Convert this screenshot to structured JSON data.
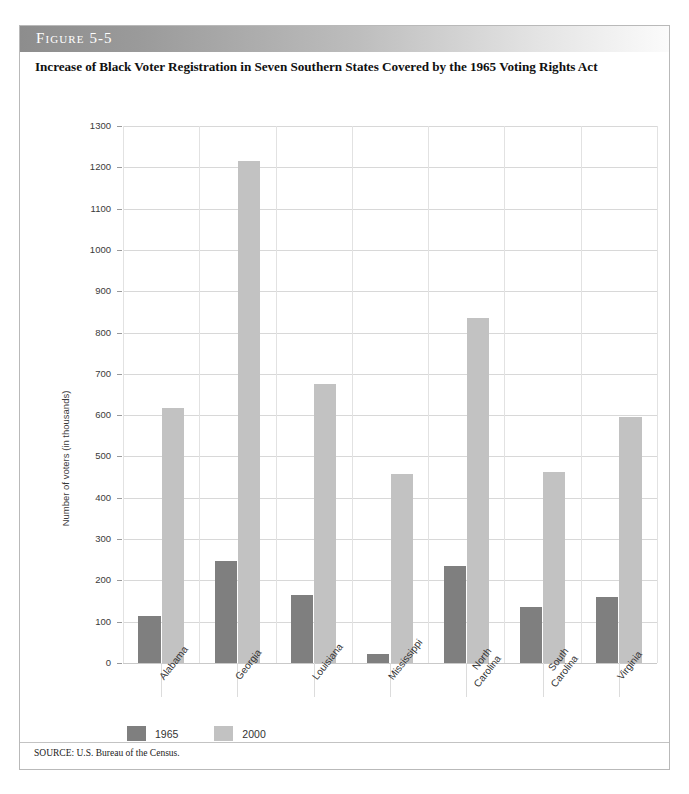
{
  "figure": {
    "label": "Figure 5-5",
    "title": "Increase of Black Voter Registration in Seven Southern States Covered by the 1965 Voting Rights Act",
    "source": "SOURCE: U.S. Bureau of the Census."
  },
  "colors": {
    "series_1965": "#7f7f7f",
    "series_2000": "#c2c2c2",
    "gridline": "#d8d8d8",
    "band_start": "#8d8d8d",
    "band_end": "#fbfbfb"
  },
  "chart_data": {
    "type": "bar",
    "title": "Increase of Black Voter Registration in Seven Southern States Covered by the 1965 Voting Rights Act",
    "xlabel": "",
    "ylabel": "Number of voters (in thousands)",
    "ylim": [
      0,
      1300
    ],
    "ytick_step": 100,
    "yticks": [
      0,
      100,
      200,
      300,
      400,
      500,
      600,
      700,
      800,
      900,
      1000,
      1100,
      1200,
      1300
    ],
    "ytick_labels": [
      "0",
      "100",
      "200",
      "300",
      "400",
      "500",
      "600",
      "700",
      "800",
      "900",
      "1000",
      "1100",
      "1200",
      "1300"
    ],
    "categories": [
      "Alabama",
      "Georgia",
      "Louisiana",
      "Mississippi",
      "North\nCarolina",
      "South\nCarolina",
      "Virginia"
    ],
    "grid": true,
    "legend_position": "below-left",
    "series": [
      {
        "name": "1965",
        "color": "#7f7f7f",
        "values": [
          113,
          248,
          165,
          22,
          235,
          135,
          160
        ]
      },
      {
        "name": "2000",
        "color": "#c2c2c2",
        "values": [
          617,
          1215,
          675,
          457,
          835,
          463,
          595
        ]
      }
    ]
  }
}
